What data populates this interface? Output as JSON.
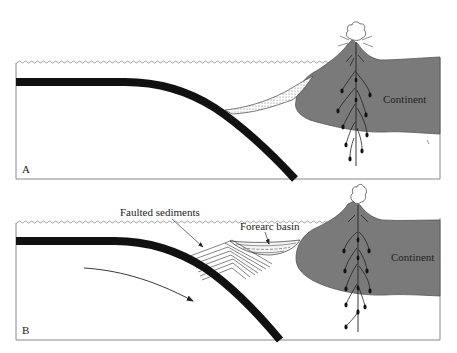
{
  "figure": {
    "panels": [
      {
        "id": "A",
        "letter": "A",
        "labels": {
          "continent": "Continent"
        },
        "features": [
          "sea-level",
          "subducting-slab",
          "trench-sediment-wedge",
          "continent",
          "volcano",
          "magma-conduits",
          "eruption-cloud"
        ]
      },
      {
        "id": "B",
        "letter": "B",
        "labels": {
          "continent": "Continent",
          "faulted_sediments": "Faulted sediments",
          "forearc_basin": "Forearc basin"
        },
        "features": [
          "sea-level",
          "subducting-slab",
          "accretionary-wedge",
          "forearc-basin",
          "continent",
          "volcano",
          "magma-conduits",
          "eruption-cloud",
          "motion-arrow"
        ]
      }
    ],
    "colors": {
      "continent": "#7a7a7a",
      "slab": "#111111",
      "line": "#333333",
      "frame": "#888888",
      "background": "#ffffff"
    }
  }
}
